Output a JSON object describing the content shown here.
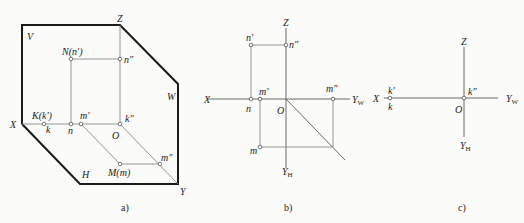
{
  "figure_a": {
    "caption": "a)",
    "plane_labels": {
      "V": "V",
      "W": "W",
      "H": "H"
    },
    "axis_labels": {
      "X": "X",
      "Y": "Y",
      "Z": "Z",
      "O": "O"
    },
    "point_labels": {
      "N": "N(n')",
      "n2": "n\"",
      "K": "K(k')",
      "k": "k",
      "n": "n",
      "m1": "m'",
      "k2": "k\"",
      "M": "M(m)",
      "m2": "m\""
    }
  },
  "figure_b": {
    "caption": "b)",
    "axis_labels": {
      "X": "X",
      "Z": "Z",
      "O": "O",
      "YW": "Y",
      "YW_sub": "W",
      "YH": "Y",
      "YH_sub": "H"
    },
    "point_labels": {
      "n1": "n'",
      "n2": "n\"",
      "n": "n",
      "m1": "m'",
      "m2": "m\"",
      "m": "m"
    }
  },
  "figure_c": {
    "caption": "c)",
    "axis_labels": {
      "X": "X",
      "Z": "Z",
      "O": "O",
      "YW": "Y",
      "YW_sub": "W",
      "YH": "Y",
      "YH_sub": "H"
    },
    "point_labels": {
      "k1": "k'",
      "k": "k",
      "k2": "k\""
    }
  }
}
